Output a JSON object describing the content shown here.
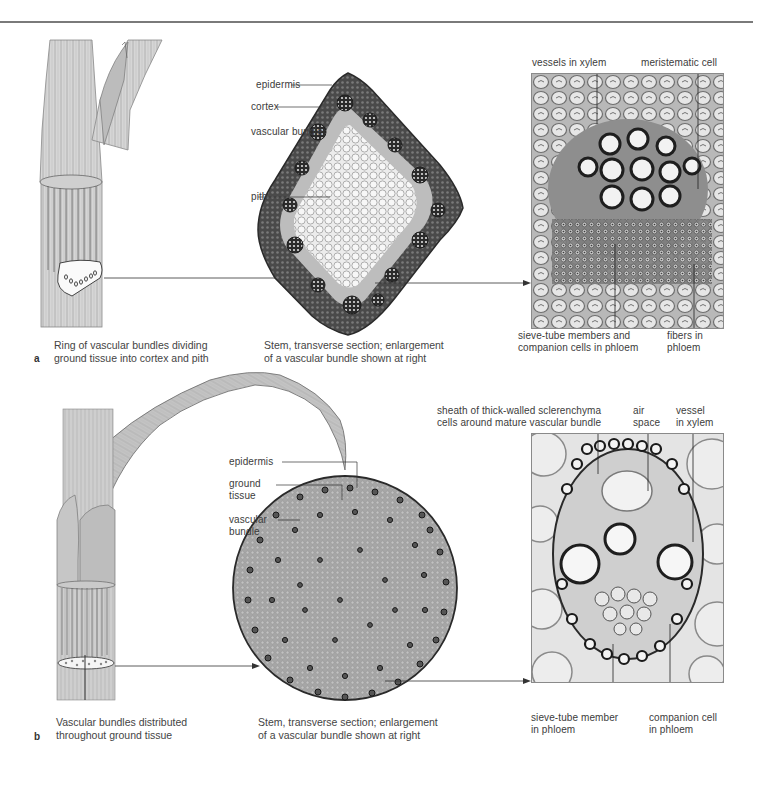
{
  "figure": {
    "panels": [
      {
        "letter": "a",
        "stem_caption": [
          "Ring of vascular bundles dividing",
          "ground tissue into cortex and pith"
        ],
        "section_caption": [
          "Stem, transverse section; enlargement",
          "of a vascular bundle shown at right"
        ],
        "section_labels": {
          "epidermis": "epidermis",
          "cortex": "cortex",
          "vascular_bundle": "vascular bundle",
          "pith": "pith"
        },
        "micrograph_labels": {
          "top_left": "vessels in xylem",
          "top_right": "meristematic cell",
          "bottom_left": [
            "sieve-tube members and",
            "companion cells in phloem"
          ],
          "bottom_right": [
            "fibers in",
            "phloem"
          ]
        }
      },
      {
        "letter": "b",
        "stem_caption": [
          "Vascular bundles distributed",
          "throughout ground tissue"
        ],
        "section_caption": [
          "Stem, transverse section; enlargement",
          "of a vascular bundle shown at right"
        ],
        "section_labels": {
          "epidermis": "epidermis",
          "ground_tissue": [
            "ground",
            "tissue"
          ],
          "vascular_bundle": [
            "vascular",
            "bundle"
          ]
        },
        "micrograph_labels": {
          "top_left": [
            "sheath of thick-walled sclerenchyma",
            "cells around mature vascular bundle"
          ],
          "top_middle": [
            "air",
            "space"
          ],
          "top_right": [
            "vessel",
            "in xylem"
          ],
          "bottom_left": [
            "sieve-tube member",
            "in phloem"
          ],
          "bottom_right": [
            "companion cell",
            "in phloem"
          ]
        }
      }
    ],
    "colors": {
      "rule": "#7a7a7a",
      "text": "#3c3c3c",
      "leader_line": "#333333",
      "stem_fill": "#cfcfcf",
      "section_dark": "#3a3a3a",
      "pith_light": "#e8e8e8",
      "ground_tissue": "#9a9a9a"
    }
  }
}
